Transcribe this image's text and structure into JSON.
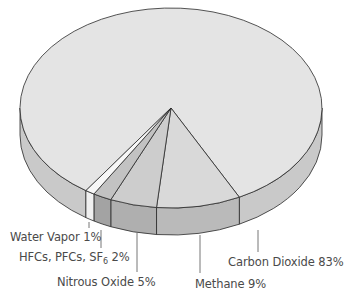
{
  "chart_data": {
    "type": "pie",
    "style": "3d-tilted",
    "title": "",
    "categories": [
      "Carbon Dioxide",
      "Methane",
      "Nitrous Oxide",
      "HFCs, PFCs, SF6",
      "Water Vapor"
    ],
    "values": [
      83,
      9,
      5,
      2,
      1
    ],
    "unit": "%",
    "labels": [
      {
        "name": "Carbon Dioxide",
        "value": "83%"
      },
      {
        "name": "Methane",
        "value": "9%"
      },
      {
        "name": "Nitrous Oxide",
        "value": "5%"
      },
      {
        "name": "HFCs, PFCs, SF",
        "subscript": "6",
        "value": "2%"
      },
      {
        "name": "Water Vapor",
        "value": "1%"
      }
    ],
    "colors": {
      "top": [
        "#e4e4e4",
        "#d9d9d9",
        "#cdcdcd",
        "#c2c2c2",
        "#f7f7f7"
      ],
      "side": [
        "#cdcdcd",
        "#bebebe",
        "#b2b2b2",
        "#a6a6a6",
        "#f5f5f5"
      ]
    },
    "legend": "none (callout labels)"
  }
}
